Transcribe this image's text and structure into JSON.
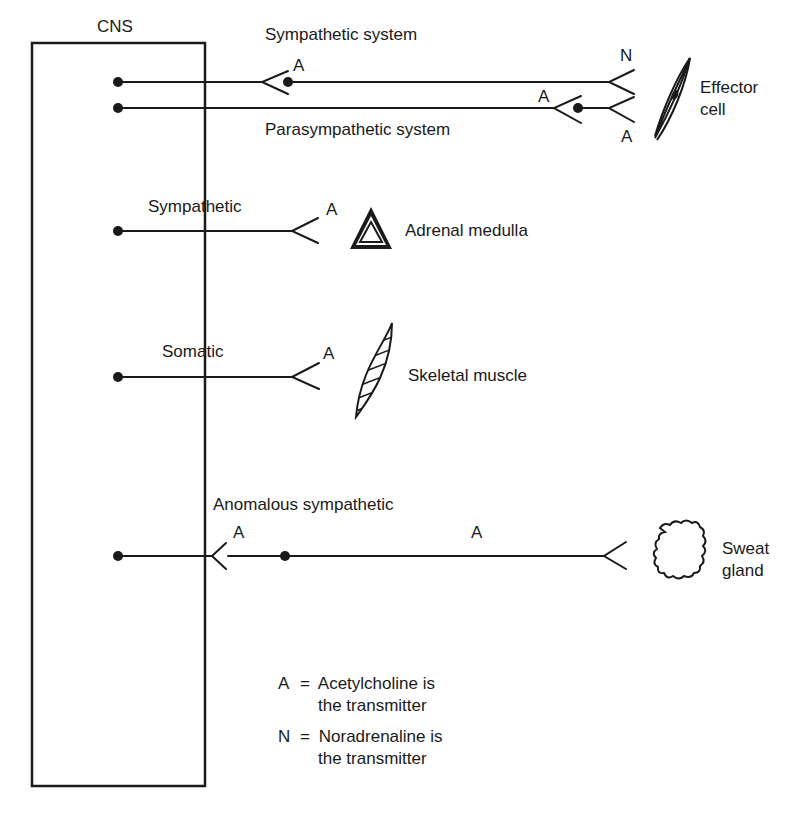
{
  "diagram": {
    "cns_label": "CNS",
    "pathways": [
      {
        "id": "sympathetic-system",
        "label": "Sympathetic system",
        "preganglionic_transmitter": "A",
        "postganglionic_transmitter": "N",
        "target": "Effector cell"
      },
      {
        "id": "parasympathetic-system",
        "label": "Parasympathetic system",
        "preganglionic_transmitter": "A",
        "postganglionic_transmitter": "A",
        "target": "Effector cell"
      },
      {
        "id": "sympathetic-adrenal",
        "label": "Sympathetic",
        "transmitter": "A",
        "target": "Adrenal medulla"
      },
      {
        "id": "somatic",
        "label": "Somatic",
        "transmitter": "A",
        "target": "Skeletal muscle"
      },
      {
        "id": "anomalous-sympathetic",
        "label": "Anomalous sympathetic",
        "preganglionic_transmitter": "A",
        "postganglionic_transmitter": "A",
        "target": "Sweat gland"
      }
    ],
    "targets": {
      "effector_line1": "Effector",
      "effector_line2": "cell",
      "adrenal": "Adrenal medulla",
      "skeletal": "Skeletal muscle",
      "sweat_line1": "Sweat",
      "sweat_line2": "gland"
    },
    "transmitter_marks": {
      "symp_ganglion": "A",
      "symp_post": "N",
      "para_ganglion": "A",
      "para_post": "A",
      "adrenal": "A",
      "somatic": "A",
      "anom_ganglion": "A",
      "anom_post": "A"
    },
    "legend": [
      {
        "symbol": "A",
        "eq": "=",
        "line1": "Acetylcholine is",
        "line2": "the transmitter"
      },
      {
        "symbol": "N",
        "eq": "=",
        "line1": "Noradrenaline is",
        "line2": "the transmitter"
      }
    ],
    "colors": {
      "ink": "#1a1a1a",
      "background": "#ffffff"
    }
  }
}
